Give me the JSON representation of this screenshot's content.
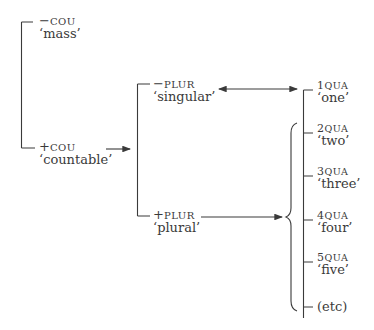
{
  "diagram": {
    "type": "system-network",
    "nodes": {
      "mass": {
        "sign": "−",
        "feature": "COU",
        "gloss": "‘mass’"
      },
      "countable": {
        "sign": "+",
        "feature": "COU",
        "gloss": "‘countable’"
      },
      "singular": {
        "sign": "−",
        "feature": "PLUR",
        "gloss": "‘singular’"
      },
      "plural": {
        "sign": "+",
        "feature": "PLUR",
        "gloss": "‘plural’"
      },
      "qua": [
        {
          "num": "1",
          "feature": "QUA",
          "gloss": "‘one’"
        },
        {
          "num": "2",
          "feature": "QUA",
          "gloss": "‘two’"
        },
        {
          "num": "3",
          "feature": "QUA",
          "gloss": "‘three’"
        },
        {
          "num": "4",
          "feature": "QUA",
          "gloss": "‘four’"
        },
        {
          "num": "5",
          "feature": "QUA",
          "gloss": "‘five’"
        }
      ],
      "etc": "(etc)"
    },
    "edges": [
      {
        "from": "countable",
        "to": "plur-system",
        "kind": "arrow"
      },
      {
        "from": "singular",
        "to": "1QUA",
        "kind": "double-arrow"
      },
      {
        "from": "plural",
        "to": "2QUA..etc",
        "kind": "arrow-to-brace"
      }
    ],
    "colors": {
      "ink": "#3a3a3a",
      "background": "#ffffff"
    }
  }
}
